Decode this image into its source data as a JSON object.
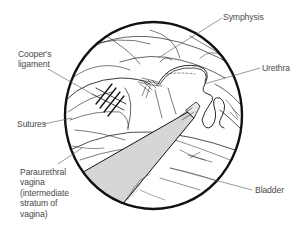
{
  "diagram": {
    "type": "anatomical endoscopic view illustration",
    "colors": {
      "ink": "#111111",
      "leader": "#555555",
      "instrument_fill": "#d6d6d6",
      "label_text": "#4a4a4a",
      "background": "#ffffff"
    },
    "labels": {
      "coopers_ligament": {
        "lines": [
          "Cooper's",
          "ligament"
        ]
      },
      "symphysis": {
        "lines": [
          "Symphysis"
        ]
      },
      "urethra": {
        "lines": [
          "Urethra"
        ]
      },
      "sutures": {
        "lines": [
          "Sutures"
        ]
      },
      "paraurethral_vagina": {
        "lines": [
          "Paraurethral",
          "vagina",
          "(intermediate",
          "stratum of",
          "vagina)"
        ]
      },
      "bladder": {
        "lines": [
          "Bladder"
        ]
      }
    }
  }
}
